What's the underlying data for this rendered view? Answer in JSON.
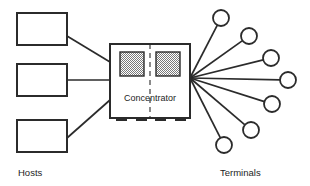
{
  "diagram": {
    "colors": {
      "stroke": "#2b2b2b",
      "fill": "#ffffff",
      "hatch": "#888888",
      "text": "#1d1d1d"
    },
    "left_group": {
      "caption": "Hosts",
      "caption_x": 18,
      "caption_y": 176,
      "nodes": [
        {
          "name": "host-box-1",
          "label": "",
          "x": 17,
          "y": 13,
          "w": 50,
          "h": 32
        },
        {
          "name": "host-box-2",
          "label": "",
          "x": 17,
          "y": 64,
          "w": 50,
          "h": 32
        },
        {
          "name": "host-box-3",
          "label": "",
          "x": 17,
          "y": 120,
          "w": 50,
          "h": 32
        }
      ]
    },
    "center": {
      "name": "concentrator",
      "label": "Concentrator",
      "label_x": 150,
      "label_y": 101,
      "x": 110,
      "y": 44,
      "w": 80,
      "h": 74,
      "divider_x": 150,
      "modules": [
        {
          "name": "concentrator-module-left",
          "x": 120,
          "y": 52,
          "w": 24,
          "h": 24
        },
        {
          "name": "concentrator-module-right",
          "x": 156,
          "y": 52,
          "w": 24,
          "h": 24
        }
      ],
      "feet": [
        {
          "x": 116,
          "y": 118,
          "w": 11,
          "h": 3
        },
        {
          "x": 136,
          "y": 118,
          "w": 11,
          "h": 3
        },
        {
          "x": 155,
          "y": 118,
          "w": 11,
          "h": 3
        },
        {
          "x": 175,
          "y": 118,
          "w": 11,
          "h": 3
        }
      ]
    },
    "right_group": {
      "caption": "Terminals",
      "caption_x": 220,
      "caption_y": 176,
      "fan_origin": {
        "x": 190,
        "y": 78
      },
      "nodes": [
        {
          "name": "terminal-1",
          "cx": 221,
          "cy": 18,
          "r": 8
        },
        {
          "name": "terminal-2",
          "cx": 249,
          "cy": 36,
          "r": 8
        },
        {
          "name": "terminal-3",
          "cx": 271,
          "cy": 58,
          "r": 8
        },
        {
          "name": "terminal-4",
          "cx": 288,
          "cy": 80,
          "r": 8
        },
        {
          "name": "terminal-5",
          "cx": 272,
          "cy": 104,
          "r": 8
        },
        {
          "name": "terminal-6",
          "cx": 251,
          "cy": 130,
          "r": 8
        },
        {
          "name": "terminal-7",
          "cx": 224,
          "cy": 145,
          "r": 8
        }
      ]
    },
    "host_links": [
      {
        "name": "host-link-1",
        "x1": 67,
        "y1": 36,
        "x2": 110,
        "y2": 62
      },
      {
        "name": "host-link-2",
        "x1": 67,
        "y1": 80,
        "x2": 110,
        "y2": 80
      },
      {
        "name": "host-link-3",
        "x1": 67,
        "y1": 138,
        "x2": 110,
        "y2": 100
      }
    ]
  }
}
